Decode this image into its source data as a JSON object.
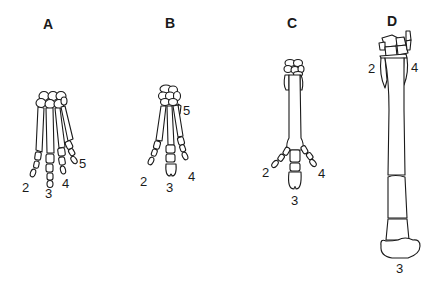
{
  "figure": {
    "panels": [
      {
        "id": "A",
        "label": "A",
        "digits": [
          "2",
          "3",
          "4",
          "5"
        ]
      },
      {
        "id": "B",
        "label": "B",
        "digits": [
          "5",
          "2",
          "3",
          "4"
        ]
      },
      {
        "id": "C",
        "label": "C",
        "digits": [
          "2",
          "4",
          "3"
        ]
      },
      {
        "id": "D",
        "label": "D",
        "digits": [
          "2",
          "4",
          "3"
        ]
      }
    ]
  }
}
